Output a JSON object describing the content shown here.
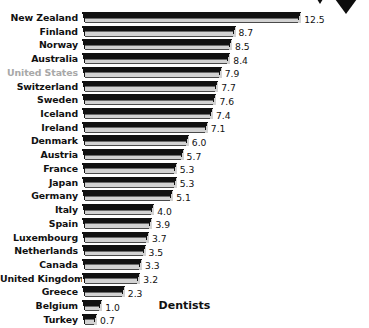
{
  "chart_data": {
    "type": "bar",
    "title": "",
    "xlabel": "Dentists",
    "ylabel": "",
    "orientation": "horizontal",
    "grid": false,
    "legend": false,
    "xlim": [
      0,
      12.5
    ],
    "categories": [
      "New Zealand",
      "Finland",
      "Norway",
      "Australia",
      "United States",
      "Switzerland",
      "Sweden",
      "Iceland",
      "Ireland",
      "Denmark",
      "Austria",
      "France",
      "Japan",
      "Germany",
      "Italy",
      "Spain",
      "Luxembourg",
      "Netherlands",
      "Canada",
      "United Kingdom",
      "Greece",
      "Belgium",
      "Turkey"
    ],
    "values": [
      12.5,
      8.7,
      8.5,
      8.4,
      7.9,
      7.7,
      7.6,
      7.4,
      7.1,
      6.0,
      5.7,
      5.3,
      5.3,
      5.1,
      4.0,
      3.9,
      3.7,
      3.5,
      3.3,
      3.2,
      2.3,
      1.0,
      0.7
    ],
    "value_labels": [
      "12.5",
      "8.7",
      "8.5",
      "8.4",
      "7.9",
      "7.7",
      "7.6",
      "7.4",
      "7.1",
      "6.0",
      "5.7",
      "5.3",
      "5.3",
      "5.1",
      "4.0",
      "3.9",
      "3.7",
      "3.5",
      "3.3",
      "3.2",
      "2.3",
      "1.0",
      "0.7"
    ],
    "highlighted_category": "United States"
  },
  "axis": {
    "title": "Dentists"
  },
  "colors": {
    "bar_top": "#111111",
    "bar_front": "#d2d2d2",
    "label": "#111111",
    "highlight_label": "#a8a8a8",
    "background": "#ffffff",
    "accent": "#0d0d0d"
  },
  "decoration": {
    "chevron_large": "triangle-down-icon",
    "chevron_small": "triangle-down-icon"
  }
}
